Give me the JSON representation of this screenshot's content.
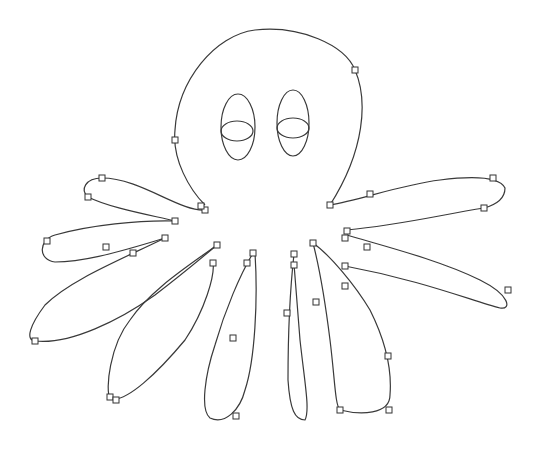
{
  "canvas": {
    "width": 538,
    "height": 449,
    "background": "#ffffff",
    "stroke_color": "#3a3a3a",
    "subject": "octopus-vector-drawing"
  },
  "shapes": {
    "head": "M205,205 C190,190 172,160 175,130 C178,80 215,35 255,30 C300,25 345,45 355,70 C368,100 365,150 330,205",
    "eyes": [
      {
        "name": "left-eye-outer",
        "cx": 238,
        "cy": 127,
        "rx": 17,
        "ry": 33
      },
      {
        "name": "left-eye-inner",
        "cx": 237,
        "cy": 131,
        "rx": 16,
        "ry": 10
      },
      {
        "name": "right-eye-outer",
        "cx": 293,
        "cy": 123,
        "rx": 16,
        "ry": 33
      },
      {
        "name": "right-eye-inner",
        "cx": 293,
        "cy": 128,
        "rx": 16,
        "ry": 10
      }
    ],
    "tentacles": [
      "M205,210 C180,212 140,178 102,178 C85,178 80,190 88,197 C110,208 150,215 175,221",
      "M175,221 C140,220 90,225 55,235 C38,240 38,260 55,262 C80,262 110,255 165,238",
      "M165,238 C120,260 70,280 45,305 C30,325 25,340 35,341 C70,345 120,320 155,295 C185,272 205,255 217,245",
      "M217,245 C190,265 150,290 130,320 C110,345 105,390 110,398 C125,405 160,370 185,340 C205,310 215,275 213,263",
      "M253,253 C240,275 225,310 215,345 C205,375 200,410 210,418 C225,425 240,410 245,390 C255,360 258,300 255,253",
      "M294,254 C290,290 288,340 288,380 C290,410 295,420 305,420 C310,410 305,385 300,340 C297,300 295,275 294,264",
      "M313,243 C320,270 325,300 330,340 C335,380 335,405 340,410 C360,415 390,415 390,395 C392,370 385,340 370,310 C355,285 330,255 313,243",
      "M330,205 C360,200 400,185 440,180 C480,175 500,178 505,188 C505,200 495,205 484,208 C440,215 400,225 347,230",
      "M347,235 C380,245 440,260 480,280 C510,295 512,310 500,308 C470,300 420,280 345,266"
    ],
    "handles": [
      [
        102,
        178
      ],
      [
        88,
        197
      ],
      [
        175,
        221
      ],
      [
        205,
        210
      ],
      [
        201,
        206
      ],
      [
        47,
        241
      ],
      [
        106,
        247
      ],
      [
        133,
        253
      ],
      [
        165,
        238
      ],
      [
        35,
        341
      ],
      [
        217,
        245
      ],
      [
        213,
        263
      ],
      [
        110,
        397
      ],
      [
        116,
        400
      ],
      [
        253,
        253
      ],
      [
        247,
        263
      ],
      [
        233,
        338
      ],
      [
        236,
        416
      ],
      [
        294,
        254
      ],
      [
        294,
        265
      ],
      [
        287,
        313
      ],
      [
        316,
        302
      ],
      [
        340,
        410
      ],
      [
        388,
        356
      ],
      [
        313,
        243
      ],
      [
        345,
        266
      ],
      [
        345,
        286
      ],
      [
        389,
        410
      ],
      [
        330,
        205
      ],
      [
        370,
        194
      ],
      [
        493,
        178
      ],
      [
        484,
        208
      ],
      [
        347,
        231
      ],
      [
        345,
        238
      ],
      [
        367,
        247
      ],
      [
        508,
        290
      ],
      [
        355,
        70
      ],
      [
        175,
        140
      ]
    ]
  }
}
